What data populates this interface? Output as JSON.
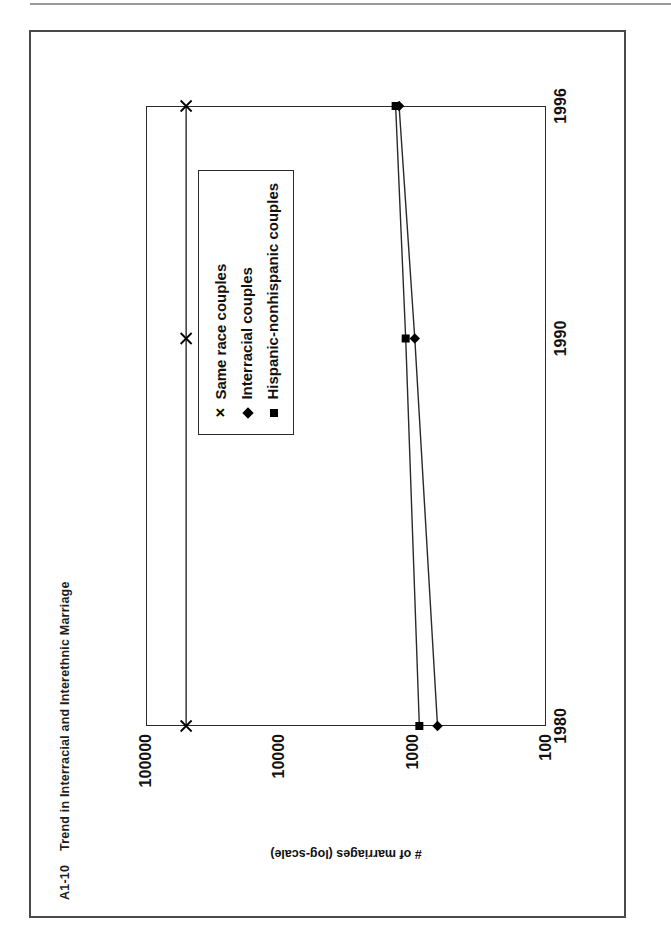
{
  "page": {
    "figure_label": "A1-10",
    "figure_title": "Trend in Interracial and Interethnic Marriage"
  },
  "chart_data": {
    "type": "line",
    "xlabel": "",
    "ylabel": "# of marriages (log-scale)",
    "x": [
      1980,
      1990,
      1996
    ],
    "xticklabels": [
      "1980",
      "1990",
      "1996"
    ],
    "yticklabels": [
      "100000",
      "10000",
      "1000",
      "100"
    ],
    "yticks": [
      100000,
      10000,
      1000,
      100
    ],
    "yscale": "log",
    "ylim": [
      100,
      100000
    ],
    "grid": false,
    "legend_position": "inside-lower-right",
    "series": [
      {
        "name": "Same race couples",
        "marker": "x",
        "values": [
          50000,
          50000,
          50000
        ]
      },
      {
        "name": "Interracial couples",
        "marker": "diamond",
        "values": [
          651,
          964,
          1264
        ]
      },
      {
        "name": "Hispanic-nonhispanic couples",
        "marker": "square",
        "values": [
          891,
          1128,
          1342
        ]
      }
    ]
  },
  "axis": {
    "y_title": "# of marriages (log-scale)",
    "y_ticks": [
      "100000",
      "10000",
      "1000",
      "100"
    ],
    "x_ticks": [
      "1980",
      "1990",
      "1996"
    ]
  },
  "legend": {
    "entries": [
      {
        "marker_glyph": "✕",
        "label": "Same race couples"
      },
      {
        "marker_glyph": "◆",
        "label": "Interracial couples"
      },
      {
        "marker_glyph": "■",
        "label": "Hispanic-nonhispanic couples"
      }
    ]
  },
  "colors": {
    "ink": "#111111",
    "frame": "#4a4a4a",
    "plot_line": "#2a2a2a",
    "page": "#ffffff"
  }
}
